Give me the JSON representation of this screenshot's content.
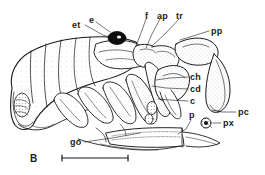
{
  "figure": {
    "panel_label": "B",
    "caption_present": false,
    "background_color": "#ffffff",
    "ink_color": "#1a1a1a"
  },
  "labels": [
    {
      "id": "et",
      "text": "et",
      "x": 72,
      "y": 21,
      "anchor": "start"
    },
    {
      "id": "e",
      "text": "e",
      "x": 89,
      "y": 17,
      "anchor": "start"
    },
    {
      "id": "f",
      "text": "f",
      "x": 145,
      "y": 13,
      "anchor": "start"
    },
    {
      "id": "ap",
      "text": "ap",
      "x": 157,
      "y": 13,
      "anchor": "start"
    },
    {
      "id": "tr",
      "text": "tr",
      "x": 176,
      "y": 13,
      "anchor": "start"
    },
    {
      "id": "pp",
      "text": "pp",
      "x": 211,
      "y": 33,
      "anchor": "start"
    },
    {
      "id": "ch",
      "text": "ch",
      "x": 190,
      "y": 79,
      "anchor": "start"
    },
    {
      "id": "cd",
      "text": "cd",
      "x": 190,
      "y": 91,
      "anchor": "start"
    },
    {
      "id": "c",
      "text": "c",
      "x": 190,
      "y": 103,
      "anchor": "start"
    },
    {
      "id": "p",
      "text": "p",
      "x": 189,
      "y": 115,
      "anchor": "start"
    },
    {
      "id": "pc",
      "text": "pc",
      "x": 238,
      "y": 114,
      "anchor": "start"
    },
    {
      "id": "px",
      "text": "px",
      "x": 223,
      "y": 125,
      "anchor": "start"
    },
    {
      "id": "go",
      "text": "go",
      "x": 70,
      "y": 144,
      "anchor": "start"
    }
  ],
  "leaders": [
    {
      "id": "leader-et",
      "from_label": "et",
      "points": "85,25 103,35 117,40"
    },
    {
      "id": "leader-e",
      "from_label": "e",
      "points": "96,22 110,32"
    },
    {
      "id": "leader-f",
      "from_label": "f",
      "points": "146,19 141,33 136,46"
    },
    {
      "id": "leader-ap",
      "from_label": "ap",
      "points": "160,19 152,34 146,48"
    },
    {
      "id": "leader-tr",
      "from_label": "tr",
      "points": "179,19 166,33 152,46"
    },
    {
      "id": "leader-pp",
      "from_label": "pp",
      "points": "209,31 193,36 180,40"
    },
    {
      "id": "leader-ch",
      "from_label": "ch",
      "points": "188,77 170,78 156,80"
    },
    {
      "id": "leader-cd",
      "from_label": "cd",
      "points": "188,89 166,88 152,86"
    },
    {
      "id": "leader-c",
      "from_label": "c",
      "points": "188,101 170,100 158,99"
    },
    {
      "id": "leader-p",
      "from_label": "p",
      "points": "191,120 186,129 178,134"
    },
    {
      "id": "leader-pc",
      "from_label": "pc",
      "points": "236,112 222,112 212,110"
    },
    {
      "id": "leader-px",
      "from_label": "px",
      "points": "221,123 213,123"
    },
    {
      "id": "leader-go",
      "from_label": "go",
      "points": "84,142 112,138 140,133"
    }
  ],
  "scalebar": {
    "id": "scale-bar",
    "x1": 62,
    "x2": 128,
    "y": 158,
    "tick_height": 5,
    "visible": true
  },
  "anatomy": {
    "note": "Lateral-view line drawing of an arthropod with stippled shading",
    "parts": [
      {
        "id": "carapace-body",
        "name": "segmented-body"
      },
      {
        "id": "eye",
        "name": "eye-dark-spot"
      },
      {
        "id": "frontal-plate",
        "name": "frontal-region"
      },
      {
        "id": "appendage-large",
        "name": "large-curved-appendage"
      },
      {
        "id": "chela",
        "name": "chela-claw"
      },
      {
        "id": "pleon",
        "name": "elongate-pleon"
      },
      {
        "id": "pleopod-round",
        "name": "round-pleopod"
      }
    ]
  }
}
